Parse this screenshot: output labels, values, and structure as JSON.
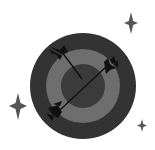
{
  "illustration": {
    "label": "Target with arrows",
    "colors": {
      "background": "#ffffff",
      "board_outer": "#333333",
      "board_ring": "#6e6e6e",
      "board_center": "#3b3b3b",
      "arrow": "#111111",
      "sparkle": "#555555"
    },
    "elements": {
      "target": "dartboard-icon",
      "arrows": [
        "arrow-icon",
        "arrow-icon"
      ],
      "sparkles": [
        "sparkle-icon",
        "sparkle-icon",
        "sparkle-icon"
      ]
    }
  }
}
